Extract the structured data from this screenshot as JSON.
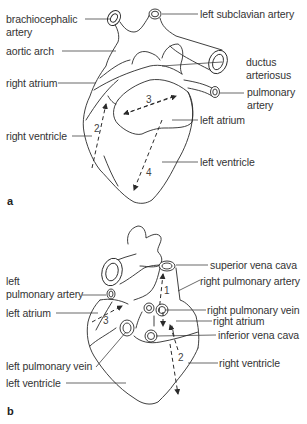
{
  "figure": {
    "panel_a": {
      "letter": "a",
      "labels": {
        "brachiocephalic": "brachiocephalic",
        "brachiocephalic_2": "artery",
        "left_subclavian": "left subclavian artery",
        "aortic_arch": "aortic arch",
        "ductus_1": "ductus",
        "ductus_2": "arteriosus",
        "right_atrium": "right atrium",
        "pulmonary_1": "pulmonary",
        "pulmonary_2": "artery",
        "left_atrium": "left atrium",
        "right_ventricle": "right ventricle",
        "left_ventricle": "left ventricle"
      },
      "axes": {
        "n2": "2",
        "n3": "3",
        "n4": "4"
      }
    },
    "panel_b": {
      "letter": "b",
      "labels": {
        "superior_vena_cava": "superior vena cava",
        "left_1": "left",
        "left_pulmonary_artery": "pulmonary artery",
        "right_pulmonary_artery": "right pulmonary artery",
        "left_atrium": "left atrium",
        "right_pulmonary_vein": "right pulmonary vein",
        "right_atrium": "right atrium",
        "inferior_vena_cava": "inferior vena cava",
        "left_pulmonary_vein": "left pulmonary vein",
        "right_ventricle": "right ventricle",
        "left_ventricle": "left ventricle"
      },
      "axes": {
        "n1": "1",
        "n2": "2",
        "n3": "3"
      }
    }
  }
}
